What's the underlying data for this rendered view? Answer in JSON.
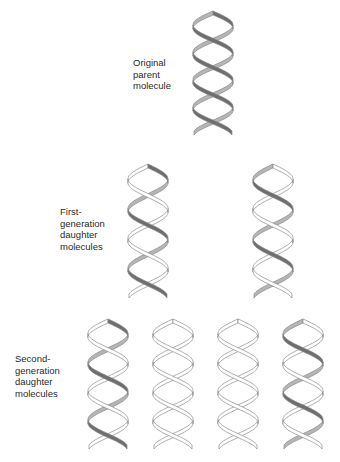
{
  "diagram": {
    "labels": {
      "parent": [
        "Original",
        "parent",
        "molecule"
      ],
      "first_gen": [
        "First-",
        "generation",
        "daughter",
        "molecules"
      ],
      "second_gen": [
        "Second-",
        "generation",
        "daughter",
        "molecules"
      ]
    },
    "colors": {
      "old_strand": "#6e6e6e",
      "new_strand": "#ffffff",
      "outline": "#8a8a8a"
    },
    "molecules": [
      {
        "id": "parent",
        "generation": 0,
        "x": 190,
        "y": 5,
        "w": 46,
        "h": 132,
        "shaded": [
          "a",
          "b"
        ]
      },
      {
        "id": "gen1-left",
        "generation": 1,
        "x": 125,
        "y": 158,
        "w": 46,
        "h": 142,
        "shaded": [
          "a"
        ]
      },
      {
        "id": "gen1-right",
        "generation": 1,
        "x": 250,
        "y": 158,
        "w": 46,
        "h": 142,
        "shaded": [
          "b"
        ]
      },
      {
        "id": "gen2-1",
        "generation": 2,
        "x": 85,
        "y": 313,
        "w": 46,
        "h": 138,
        "shaded": [
          "a"
        ]
      },
      {
        "id": "gen2-2",
        "generation": 2,
        "x": 150,
        "y": 313,
        "w": 46,
        "h": 138,
        "shaded": []
      },
      {
        "id": "gen2-3",
        "generation": 2,
        "x": 215,
        "y": 313,
        "w": 46,
        "h": 138,
        "shaded": []
      },
      {
        "id": "gen2-4",
        "generation": 2,
        "x": 280,
        "y": 313,
        "w": 46,
        "h": 138,
        "shaded": [
          "b"
        ]
      }
    ]
  }
}
